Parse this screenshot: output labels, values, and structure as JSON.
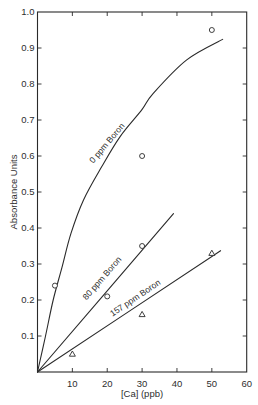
{
  "figure": {
    "width": 258,
    "height": 405,
    "background": "#ffffff",
    "ink": "#2a2a2a"
  },
  "chart_data": {
    "type": "line",
    "title": "",
    "xlabel": "[Ca] (ppb)",
    "ylabel": "Absorbance Units",
    "xlim": [
      0,
      60
    ],
    "ylim": [
      0,
      1.0
    ],
    "xticks": [
      10,
      20,
      30,
      40,
      50,
      60
    ],
    "xtick_labels": [
      "10",
      "20",
      "30",
      "40",
      "50",
      "60"
    ],
    "yticks": [
      0.1,
      0.2,
      0.3,
      0.4,
      0.5,
      0.6,
      0.7,
      0.8,
      0.9,
      1.0
    ],
    "ytick_labels": [
      "0.1",
      "0.2",
      "0.3",
      "0.4",
      "0.5",
      "0.6",
      "0.7",
      "0.8",
      "0.9",
      "1.0"
    ],
    "grid": false,
    "legend": "none (series labeled inline along curves)",
    "series": [
      {
        "name": "0 ppm Boron",
        "marker": "circle",
        "points": [
          [
            5,
            0.24
          ],
          [
            30,
            0.6
          ],
          [
            50,
            0.95
          ]
        ],
        "curve": [
          [
            0,
            0
          ],
          [
            2.3,
            0.1
          ],
          [
            4.5,
            0.2
          ],
          [
            7.0,
            0.29
          ],
          [
            9.6,
            0.385
          ],
          [
            13.2,
            0.478
          ],
          [
            18.4,
            0.57
          ],
          [
            23.7,
            0.654
          ],
          [
            29.9,
            0.728
          ],
          [
            33.2,
            0.774
          ],
          [
            42.8,
            0.867
          ],
          [
            53.1,
            0.924
          ]
        ],
        "label": {
          "text": "0 ppm Boron",
          "x": 19.9,
          "y": 0.636,
          "angle": -50
        }
      },
      {
        "name": "80 ppm Boron",
        "marker": "circle",
        "points": [
          [
            20,
            0.21
          ],
          [
            30,
            0.35
          ]
        ],
        "curve": [
          [
            0,
            0
          ],
          [
            39,
            0.44
          ]
        ],
        "label": {
          "text": "80 ppm Boron",
          "x": 18.5,
          "y": 0.261,
          "angle": -49
        }
      },
      {
        "name": "157 ppm Boron",
        "marker": "triangle",
        "points": [
          [
            10,
            0.05
          ],
          [
            30,
            0.16
          ],
          [
            50,
            0.33
          ]
        ],
        "curve": [
          [
            0,
            0
          ],
          [
            52.5,
            0.337
          ]
        ],
        "label": {
          "text": "157 ppm Boron",
          "x": 28.0,
          "y": 0.206,
          "angle": -34
        }
      }
    ]
  }
}
